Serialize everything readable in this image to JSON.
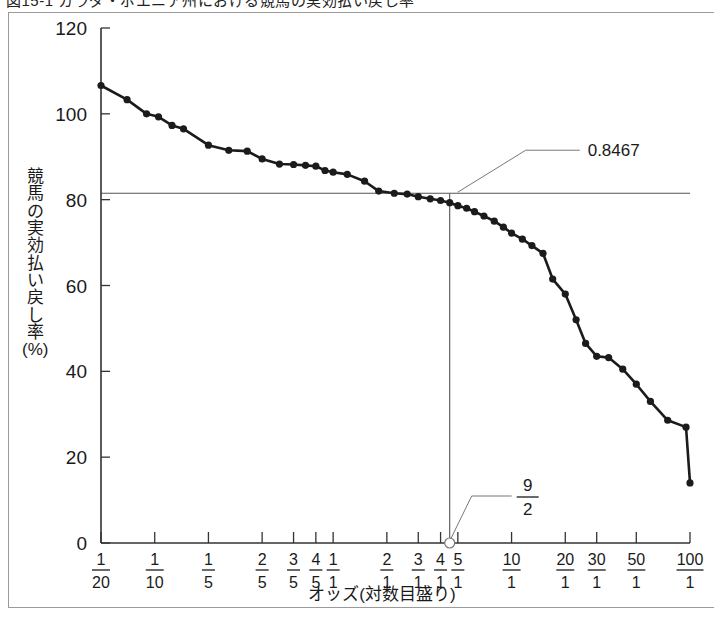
{
  "figure": {
    "caption_cut": "図15-1 カラダ・ポエニア州における競馬の実効払い戻し率",
    "axis_y_title_chars": [
      "競",
      "馬",
      "の",
      "実",
      "効",
      "払",
      "い",
      "戻",
      "し",
      "率"
    ],
    "axis_y_title_unit": "(%)",
    "axis_x_title": "オッズ(対数目盛り)"
  },
  "chart_data": {
    "type": "line",
    "title": "",
    "subtitle": "",
    "xlabel": "オッズ(対数目盛り)",
    "ylabel": "競馬の実効払い戻し率 (%)",
    "xscale": "log",
    "xlim": [
      0.05,
      100
    ],
    "ylim": [
      0,
      120
    ],
    "ytick_values": [
      0,
      20,
      40,
      60,
      80,
      100,
      120
    ],
    "ytick_labels": [
      "0",
      "20",
      "40",
      "60",
      "80",
      "100",
      "120"
    ],
    "grid": false,
    "legend": false,
    "xtick_labels": [
      {
        "num": "1",
        "den": "20",
        "value": 0.05
      },
      {
        "num": "1",
        "den": "10",
        "value": 0.1
      },
      {
        "num": "1",
        "den": "5",
        "value": 0.2
      },
      {
        "num": "2",
        "den": "5",
        "value": 0.4
      },
      {
        "num": "3",
        "den": "5",
        "value": 0.6
      },
      {
        "num": "4",
        "den": "5",
        "value": 0.8
      },
      {
        "num": "1",
        "den": "1",
        "value": 1.0
      },
      {
        "num": "2",
        "den": "1",
        "value": 2.0
      },
      {
        "num": "3",
        "den": "1",
        "value": 3.0
      },
      {
        "num": "4",
        "den": "1",
        "value": 4.0
      },
      {
        "num": "5",
        "den": "1",
        "value": 5.0
      },
      {
        "num": "10",
        "den": "1",
        "value": 10.0
      },
      {
        "num": "20",
        "den": "1",
        "value": 20.0
      },
      {
        "num": "30",
        "den": "1",
        "value": 30.0
      },
      {
        "num": "50",
        "den": "1",
        "value": 50.0
      },
      {
        "num": "100",
        "den": "1",
        "value": 100.0
      }
    ],
    "series": [
      {
        "name": "実効払い戻し率",
        "x": [
          0.05,
          0.07,
          0.09,
          0.105,
          0.125,
          0.145,
          0.2,
          0.26,
          0.33,
          0.4,
          0.5,
          0.6,
          0.7,
          0.8,
          0.9,
          1.0,
          1.2,
          1.5,
          1.8,
          2.2,
          2.6,
          3.0,
          3.5,
          4.0,
          4.5,
          5.0,
          5.6,
          6.2,
          7.0,
          8.0,
          9.0,
          10.0,
          11.5,
          13.0,
          15.0,
          17.0,
          20.0,
          23.0,
          26.0,
          30.0,
          35.0,
          42.0,
          50.0,
          60.0,
          75.0,
          95.0,
          100.0
        ],
        "y": [
          106.6,
          103.3,
          100.0,
          99.3,
          97.3,
          96.5,
          92.7,
          91.5,
          91.3,
          89.5,
          88.3,
          88.2,
          88.0,
          87.8,
          86.8,
          86.4,
          85.9,
          84.3,
          82.0,
          81.5,
          81.3,
          80.7,
          80.2,
          79.8,
          79.3,
          78.6,
          78.0,
          77.2,
          76.2,
          75.0,
          73.6,
          72.2,
          70.8,
          69.3,
          67.5,
          61.5,
          58.0,
          52.0,
          46.5,
          43.5,
          43.2,
          40.5,
          37.0,
          33.0,
          28.6,
          27.0,
          14.0
        ]
      }
    ],
    "reference_lines": [
      {
        "orientation": "horizontal",
        "value": 81.5,
        "label": "0.8467"
      },
      {
        "orientation": "vertical",
        "value": 4.5,
        "label": "9/2"
      }
    ],
    "annotations": [
      {
        "name": "payout-ratio-annotation",
        "text": "0.8467",
        "anchor_x": 4.5,
        "anchor_y": 81.5
      },
      {
        "name": "odds-annotation-numerator",
        "text": "9"
      },
      {
        "name": "odds-annotation-denominator",
        "text": "2"
      }
    ],
    "marker_on_axis": {
      "x": 4.5,
      "y": 0,
      "style": "open-circle"
    }
  }
}
